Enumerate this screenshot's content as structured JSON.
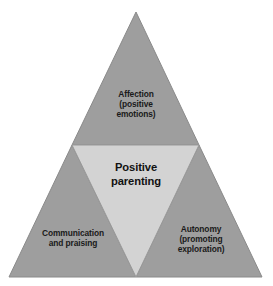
{
  "diagram": {
    "type": "triangle-venn",
    "background_color": "#ffffff",
    "outer_fill": "#9e9e9e",
    "inner_fill": "#d3d3d3",
    "stroke_color": "#8a8a8a",
    "text_color": "#1a1a1a",
    "center": {
      "label": "Positive\nparenting",
      "line1": "Positive",
      "line2": "parenting",
      "fill": "#d3d3d3"
    },
    "segments": [
      {
        "id": "affection",
        "position": "top",
        "label": "Affection\n(positive\nemotions)",
        "line1": "Affection",
        "line2": "(positive",
        "line3": "emotions)",
        "fill": "#9e9e9e"
      },
      {
        "id": "communication",
        "position": "bottom-left",
        "label": "Communication\nand praising",
        "line1": "Communication",
        "line2": "and praising",
        "fill": "#9e9e9e"
      },
      {
        "id": "autonomy",
        "position": "bottom-right",
        "label": "Autonomy\n(promoting\nexploration)",
        "line1": "Autonomy",
        "line2": "(promoting",
        "line3": "exploration)",
        "fill": "#9e9e9e"
      }
    ]
  }
}
